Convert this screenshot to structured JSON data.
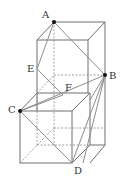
{
  "figure": {
    "points": {
      "A": {
        "label": "A",
        "x": 54,
        "y": 22
      },
      "B": {
        "label": "B",
        "x": 105,
        "y": 75
      },
      "C": {
        "label": "C",
        "x": 20,
        "y": 111
      },
      "D": {
        "label": "D",
        "x": 72,
        "y": 163
      },
      "E": {
        "label": "E",
        "x": 37,
        "y": 69
      },
      "F": {
        "label": "F",
        "x": 63,
        "y": 95
      }
    },
    "colors": {
      "edge": "#6e6e6e",
      "hidden_edge": "#8a8a8a",
      "vertex_dot": "#111111"
    }
  }
}
